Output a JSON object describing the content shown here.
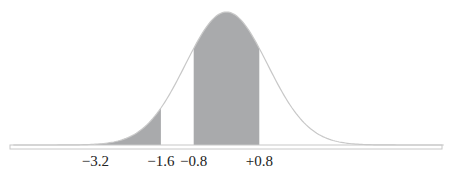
{
  "chart_data": {
    "type": "area",
    "title": "",
    "distribution": {
      "mean": 0,
      "sd": 1
    },
    "x_range": [
      -5.2,
      5.3
    ],
    "shaded_regions": [
      {
        "from": -3.2,
        "to": -1.6
      },
      {
        "from": -0.8,
        "to": 0.8
      }
    ],
    "tick_labels": [
      {
        "value": -3.2,
        "label": "−3.2"
      },
      {
        "value": -1.6,
        "label": "−1.6"
      },
      {
        "value": -0.8,
        "label": "−0.8"
      },
      {
        "value": 0.8,
        "label": "+0.8"
      }
    ],
    "xlabel": "",
    "ylabel": "",
    "grid": false,
    "colors": {
      "shade": "#a9aaac",
      "curve": "#c8c8c8",
      "baseline": "#c8c8c8"
    }
  }
}
